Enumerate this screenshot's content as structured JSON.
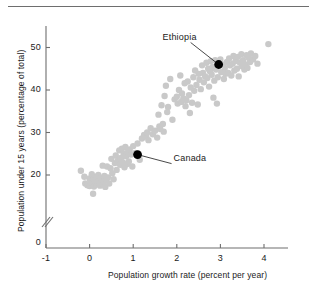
{
  "chart_data": {
    "type": "scatter",
    "title": "",
    "xlabel": "Population growth rate (percent per year)",
    "ylabel": "Population under 15 years (percentage of total)",
    "xlim": [
      -1,
      4.6
    ],
    "ylim": [
      14,
      53
    ],
    "xticks": [
      -1,
      0,
      1,
      2,
      3,
      4
    ],
    "xtick_labels": [
      "-1",
      "0",
      "1",
      "2",
      "3",
      "4"
    ],
    "yticks": [
      20,
      30,
      40,
      50
    ],
    "ytick_labels": [
      "20",
      "30",
      "40",
      "50"
    ],
    "y_origin_label": "0",
    "axis_break": true,
    "grid": false,
    "legend": null,
    "point_color": "#c9c9c9",
    "highlight_color": "#000000",
    "axis_color": "#6e6e6e",
    "points": [
      [
        -0.2,
        21.0
      ],
      [
        -0.12,
        19.6
      ],
      [
        -0.1,
        18.0
      ],
      [
        -0.05,
        17.6
      ],
      [
        0.0,
        19.2
      ],
      [
        0.0,
        17.4
      ],
      [
        0.02,
        18.6
      ],
      [
        0.05,
        20.2
      ],
      [
        0.06,
        18.1
      ],
      [
        0.08,
        15.6
      ],
      [
        0.1,
        19.0
      ],
      [
        0.1,
        17.3
      ],
      [
        0.12,
        18.4
      ],
      [
        0.15,
        19.6
      ],
      [
        0.16,
        17.8
      ],
      [
        0.18,
        18.2
      ],
      [
        0.2,
        20.0
      ],
      [
        0.22,
        18.6
      ],
      [
        0.24,
        17.5
      ],
      [
        0.26,
        19.3
      ],
      [
        0.28,
        18.0
      ],
      [
        0.3,
        22.2
      ],
      [
        0.32,
        18.4
      ],
      [
        0.34,
        19.8
      ],
      [
        0.36,
        17.2
      ],
      [
        0.38,
        18.8
      ],
      [
        0.4,
        22.0
      ],
      [
        0.42,
        19.4
      ],
      [
        0.45,
        18.0
      ],
      [
        0.48,
        21.6
      ],
      [
        0.5,
        23.8
      ],
      [
        0.52,
        20.4
      ],
      [
        0.55,
        19.0
      ],
      [
        0.58,
        22.8
      ],
      [
        0.6,
        24.6
      ],
      [
        0.62,
        21.2
      ],
      [
        0.65,
        23.4
      ],
      [
        0.68,
        25.8
      ],
      [
        0.7,
        22.4
      ],
      [
        0.72,
        24.0
      ],
      [
        0.74,
        26.2
      ],
      [
        0.76,
        23.0
      ],
      [
        0.78,
        25.0
      ],
      [
        0.8,
        21.8
      ],
      [
        0.82,
        26.6
      ],
      [
        0.84,
        24.4
      ],
      [
        0.86,
        22.6
      ],
      [
        0.88,
        25.4
      ],
      [
        0.9,
        23.2
      ],
      [
        0.92,
        26.0
      ],
      [
        0.95,
        24.8
      ],
      [
        0.98,
        22.0
      ],
      [
        1.0,
        26.8
      ],
      [
        1.05,
        25.2
      ],
      [
        1.1,
        27.4
      ],
      [
        1.15,
        23.6
      ],
      [
        1.2,
        28.6
      ],
      [
        1.25,
        29.4
      ],
      [
        1.3,
        29.0
      ],
      [
        1.32,
        30.0
      ],
      [
        1.35,
        28.2
      ],
      [
        1.4,
        31.0
      ],
      [
        1.45,
        29.6
      ],
      [
        1.5,
        30.4
      ],
      [
        1.55,
        28.8
      ],
      [
        1.58,
        34.2
      ],
      [
        1.6,
        31.4
      ],
      [
        1.62,
        30.8
      ],
      [
        1.65,
        36.4
      ],
      [
        1.68,
        32.0
      ],
      [
        1.7,
        30.2
      ],
      [
        1.72,
        38.6
      ],
      [
        1.75,
        41.0
      ],
      [
        1.78,
        34.8
      ],
      [
        1.8,
        36.0
      ],
      [
        1.85,
        42.6
      ],
      [
        1.9,
        33.0
      ],
      [
        1.95,
        37.8
      ],
      [
        2.0,
        38.4
      ],
      [
        2.02,
        36.8
      ],
      [
        2.05,
        40.0
      ],
      [
        2.08,
        43.4
      ],
      [
        2.1,
        37.2
      ],
      [
        2.12,
        39.2
      ],
      [
        2.15,
        38.0
      ],
      [
        2.18,
        41.6
      ],
      [
        2.2,
        36.2
      ],
      [
        2.22,
        37.6
      ],
      [
        2.25,
        42.0
      ],
      [
        2.28,
        38.8
      ],
      [
        2.3,
        34.6
      ],
      [
        2.32,
        40.6
      ],
      [
        2.35,
        37.0
      ],
      [
        2.38,
        43.0
      ],
      [
        2.4,
        39.8
      ],
      [
        2.42,
        44.6
      ],
      [
        2.45,
        41.2
      ],
      [
        2.48,
        36.6
      ],
      [
        2.5,
        43.8
      ],
      [
        2.52,
        42.4
      ],
      [
        2.55,
        40.2
      ],
      [
        2.58,
        45.8
      ],
      [
        2.6,
        44.0
      ],
      [
        2.62,
        41.8
      ],
      [
        2.65,
        43.2
      ],
      [
        2.68,
        46.4
      ],
      [
        2.7,
        42.8
      ],
      [
        2.72,
        45.0
      ],
      [
        2.74,
        40.8
      ],
      [
        2.76,
        44.4
      ],
      [
        2.78,
        46.8
      ],
      [
        2.8,
        43.6
      ],
      [
        2.82,
        45.4
      ],
      [
        2.84,
        38.2
      ],
      [
        2.86,
        42.2
      ],
      [
        2.88,
        47.0
      ],
      [
        2.9,
        44.8
      ],
      [
        2.92,
        36.8
      ],
      [
        2.94,
        43.0
      ],
      [
        2.96,
        45.6
      ],
      [
        3.0,
        47.2
      ],
      [
        3.02,
        44.2
      ],
      [
        3.05,
        46.0
      ],
      [
        3.08,
        42.6
      ],
      [
        3.1,
        45.2
      ],
      [
        3.12,
        43.8
      ],
      [
        3.15,
        46.6
      ],
      [
        3.18,
        44.0
      ],
      [
        3.2,
        47.4
      ],
      [
        3.22,
        45.8
      ],
      [
        3.25,
        43.4
      ],
      [
        3.28,
        46.2
      ],
      [
        3.3,
        48.0
      ],
      [
        3.32,
        44.6
      ],
      [
        3.35,
        46.8
      ],
      [
        3.38,
        45.0
      ],
      [
        3.4,
        47.8
      ],
      [
        3.42,
        43.2
      ],
      [
        3.45,
        46.4
      ],
      [
        3.48,
        48.4
      ],
      [
        3.5,
        45.6
      ],
      [
        3.52,
        47.0
      ],
      [
        3.55,
        44.8
      ],
      [
        3.58,
        46.0
      ],
      [
        3.6,
        48.2
      ],
      [
        3.62,
        45.2
      ],
      [
        3.65,
        47.6
      ],
      [
        3.68,
        46.6
      ],
      [
        3.7,
        48.6
      ],
      [
        3.75,
        47.2
      ],
      [
        3.8,
        48.0
      ],
      [
        3.85,
        46.2
      ],
      [
        4.1,
        50.8
      ]
    ],
    "highlights": [
      {
        "name": "Ethiopia",
        "x": 2.96,
        "y": 46.0,
        "label_dx": -28,
        "label_dy": -22
      },
      {
        "name": "Canada",
        "x": 1.1,
        "y": 24.8,
        "label_dx": 34,
        "label_dy": 9
      }
    ]
  }
}
